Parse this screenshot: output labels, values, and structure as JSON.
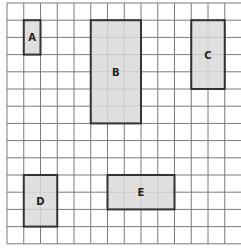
{
  "diagram": {
    "type": "grid-with-rectangles",
    "grid": {
      "columns": 14,
      "rows": 14,
      "origin_x": 7,
      "origin_y": 3,
      "cell_w": 16.75,
      "cell_h": 17.2,
      "line_color": "#7a7a7a"
    },
    "style": {
      "fill": "#d9d9d9",
      "stroke": "#333333"
    },
    "shapes": [
      {
        "label": "A",
        "col": 1,
        "row": 1,
        "w": 1,
        "h": 2
      },
      {
        "label": "B",
        "col": 5,
        "row": 1,
        "w": 3,
        "h": 6
      },
      {
        "label": "C",
        "col": 11,
        "row": 1,
        "w": 2,
        "h": 4
      },
      {
        "label": "D",
        "col": 1,
        "row": 10,
        "w": 2,
        "h": 3
      },
      {
        "label": "E",
        "col": 6,
        "row": 10,
        "w": 4,
        "h": 2
      }
    ]
  }
}
